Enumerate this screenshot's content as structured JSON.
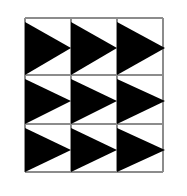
{
  "figure": {
    "canvas": {
      "width": 187,
      "height": 196,
      "background_color": "#ffffff"
    },
    "grid": {
      "line_color": "#8c8c8c",
      "line_width": 1.4,
      "vertical_x": [
        25,
        71,
        117,
        163
      ],
      "horizontal_y": [
        18,
        75,
        124,
        172
      ],
      "columns": 3,
      "rows": 3
    },
    "triangles": {
      "count": 9,
      "fill_color": "#000000",
      "orientation": "right-pointing",
      "top_inset": 4,
      "apex_overshoot": 2,
      "items": [
        {
          "name": "triangle-r1-c1",
          "row": 1,
          "col": 1,
          "left": 25,
          "top": 22,
          "bottom": 75,
          "apex_x": 71,
          "apex_y": 48
        },
        {
          "name": "triangle-r1-c2",
          "row": 1,
          "col": 2,
          "left": 71,
          "top": 22,
          "bottom": 75,
          "apex_x": 117,
          "apex_y": 48
        },
        {
          "name": "triangle-r1-c3",
          "row": 1,
          "col": 3,
          "left": 117,
          "top": 22,
          "bottom": 75,
          "apex_x": 165,
          "apex_y": 48
        },
        {
          "name": "triangle-r2-c1",
          "row": 2,
          "col": 1,
          "left": 25,
          "top": 79,
          "bottom": 124,
          "apex_x": 71,
          "apex_y": 101
        },
        {
          "name": "triangle-r2-c2",
          "row": 2,
          "col": 2,
          "left": 71,
          "top": 79,
          "bottom": 124,
          "apex_x": 117,
          "apex_y": 101
        },
        {
          "name": "triangle-r2-c3",
          "row": 2,
          "col": 3,
          "left": 117,
          "top": 79,
          "bottom": 124,
          "apex_x": 165,
          "apex_y": 101
        },
        {
          "name": "triangle-r3-c1",
          "row": 3,
          "col": 1,
          "left": 25,
          "top": 128,
          "bottom": 172,
          "apex_x": 71,
          "apex_y": 150
        },
        {
          "name": "triangle-r3-c2",
          "row": 3,
          "col": 2,
          "left": 71,
          "top": 128,
          "bottom": 172,
          "apex_x": 117,
          "apex_y": 150
        },
        {
          "name": "triangle-r3-c3",
          "row": 3,
          "col": 3,
          "left": 117,
          "top": 128,
          "bottom": 172,
          "apex_x": 165,
          "apex_y": 150
        }
      ]
    }
  }
}
